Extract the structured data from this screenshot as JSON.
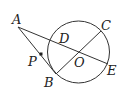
{
  "diagram": {
    "type": "geometry",
    "circle": {
      "center": "O",
      "cx": 78.5,
      "cy": 52,
      "r": 31
    },
    "points": {
      "A": {
        "x": 18,
        "y": 27,
        "label": "A"
      },
      "B": {
        "x": 56,
        "y": 74,
        "label": "B"
      },
      "C": {
        "x": 101,
        "y": 31,
        "label": "C"
      },
      "D": {
        "x": 50,
        "y": 40,
        "label": "D"
      },
      "E": {
        "x": 108,
        "y": 64,
        "label": "E"
      },
      "O": {
        "x": 78.5,
        "y": 52,
        "label": "O"
      },
      "P": {
        "x": 41,
        "y": 54,
        "label": "P"
      }
    },
    "segments": [
      "AE",
      "AB",
      "BC"
    ],
    "stroke_color": "#333333"
  }
}
